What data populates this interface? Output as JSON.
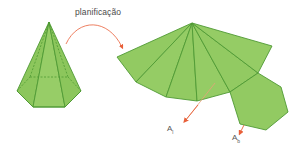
{
  "diagram": {
    "title": "planificação",
    "labels": {
      "lateral_area": {
        "main": "A",
        "sub": "l"
      },
      "base_area": {
        "main": "A",
        "sub": "b"
      }
    },
    "colors": {
      "face_fill": "#8fc85f",
      "face_fill_light": "#a2d274",
      "edge": "#4f9a34",
      "arrow": "#e8603a",
      "text": "#555555"
    },
    "solid": {
      "name": "hexagonal pyramid",
      "apex": [
        49,
        22
      ],
      "base_front": [
        [
          17,
          91
        ],
        [
          33,
          107
        ],
        [
          65,
          107
        ],
        [
          81,
          91
        ]
      ],
      "base_back": [
        [
          68,
          77
        ],
        [
          30,
          77
        ]
      ]
    },
    "net": {
      "apex": [
        192,
        23
      ],
      "lateral_outer_vertices": [
        [
          117,
          57
        ],
        [
          136,
          82
        ],
        [
          166,
          97
        ],
        [
          197,
          101
        ],
        [
          230,
          92
        ],
        [
          258,
          73
        ],
        [
          272,
          46
        ]
      ],
      "base_hexagon": [
        [
          230,
          92
        ],
        [
          258,
          73
        ],
        [
          281,
          87
        ],
        [
          288,
          112
        ],
        [
          266,
          130
        ],
        [
          240,
          124
        ]
      ]
    }
  }
}
